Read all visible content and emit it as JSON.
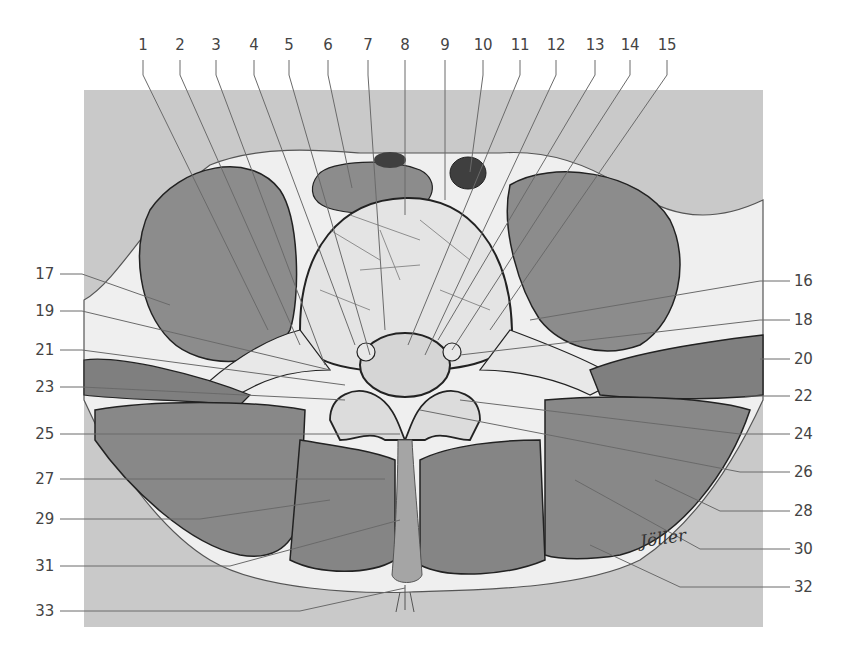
{
  "figure": {
    "signature": "Jöller",
    "colors": {
      "background_box": "#c8c8c8",
      "muscle": "#8a8a8a",
      "muscle_dark": "#555555",
      "fat_connective": "#ececec",
      "bone": "#dedede",
      "vessel_dark": "#3a3a3a",
      "outline": "#222222",
      "leader_line": "#6a6a6a",
      "label_text": "#444444"
    }
  },
  "labels": {
    "top": [
      {
        "n": "1",
        "x": 143
      },
      {
        "n": "2",
        "x": 180
      },
      {
        "n": "3",
        "x": 216
      },
      {
        "n": "4",
        "x": 254
      },
      {
        "n": "5",
        "x": 289
      },
      {
        "n": "6",
        "x": 328
      },
      {
        "n": "7",
        "x": 368
      },
      {
        "n": "8",
        "x": 405
      },
      {
        "n": "9",
        "x": 445
      },
      {
        "n": "10",
        "x": 483
      },
      {
        "n": "11",
        "x": 520
      },
      {
        "n": "12",
        "x": 556
      },
      {
        "n": "13",
        "x": 595
      },
      {
        "n": "14",
        "x": 630
      },
      {
        "n": "15",
        "x": 667
      }
    ],
    "left": [
      {
        "n": "17",
        "y": 274
      },
      {
        "n": "19",
        "y": 311
      },
      {
        "n": "21",
        "y": 350
      },
      {
        "n": "23",
        "y": 387
      },
      {
        "n": "25",
        "y": 434
      },
      {
        "n": "27",
        "y": 479
      },
      {
        "n": "29",
        "y": 519
      },
      {
        "n": "31",
        "y": 566
      },
      {
        "n": "33",
        "y": 611
      }
    ],
    "right": [
      {
        "n": "16",
        "y": 281
      },
      {
        "n": "18",
        "y": 320
      },
      {
        "n": "20",
        "y": 359
      },
      {
        "n": "22",
        "y": 396
      },
      {
        "n": "24",
        "y": 434
      },
      {
        "n": "26",
        "y": 472
      },
      {
        "n": "28",
        "y": 511
      },
      {
        "n": "30",
        "y": 549
      },
      {
        "n": "32",
        "y": 587
      }
    ]
  }
}
